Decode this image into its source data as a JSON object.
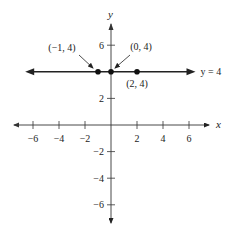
{
  "chart_data": {
    "type": "line",
    "title": "",
    "xlabel": "x",
    "ylabel": "y",
    "xlim": [
      -7,
      7
    ],
    "ylim": [
      -7,
      7
    ],
    "grid": false,
    "xticks": [
      -6,
      -4,
      -2,
      2,
      4,
      6
    ],
    "yticks": [
      -6,
      -4,
      -2,
      2,
      6
    ],
    "xtick_labels": [
      "−6",
      "−4",
      "−2",
      "2",
      "4",
      "6"
    ],
    "ytick_labels": [
      "−6",
      "−4",
      "−2",
      "2",
      "6"
    ],
    "series": [
      {
        "name": "y = 4",
        "kind": "horizontal-line",
        "y": 4,
        "x_range": [
          -6.6,
          6.5
        ],
        "arrows": "both",
        "label": "y = 4"
      }
    ],
    "points": [
      {
        "x": -1,
        "y": 4,
        "label": "(−1, 4)",
        "annotation": "arrow"
      },
      {
        "x": 0,
        "y": 4,
        "label": "(0, 4)",
        "annotation": "arrow"
      },
      {
        "x": 2,
        "y": 4,
        "label": "(2, 4)",
        "annotation": "below"
      }
    ],
    "colors": {
      "axis": "#333333",
      "line": "#222222",
      "point": "#111111",
      "text": "#222222"
    }
  }
}
